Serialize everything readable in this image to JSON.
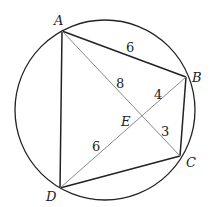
{
  "diagram": {
    "type": "cyclic-quadrilateral",
    "points": {
      "A": {
        "label": "A",
        "x": 62,
        "y": 31,
        "lx": 54,
        "ly": 25
      },
      "B": {
        "label": "B",
        "x": 186,
        "y": 77,
        "lx": 192,
        "ly": 82
      },
      "C": {
        "label": "C",
        "x": 180,
        "y": 156,
        "lx": 186,
        "ly": 167
      },
      "D": {
        "label": "D",
        "x": 60,
        "y": 188,
        "lx": 46,
        "ly": 201
      },
      "E": {
        "label": "E",
        "x": 143,
        "y": 116,
        "lx": 121,
        "ly": 126
      }
    },
    "circle": {
      "cx": 105,
      "cy": 110,
      "r": 90
    },
    "lengths": [
      {
        "segment": "AB",
        "value": "6",
        "x": 126,
        "y": 52
      },
      {
        "segment": "AE",
        "value": "8",
        "x": 116,
        "y": 88
      },
      {
        "segment": "BE",
        "value": "4",
        "x": 154,
        "y": 99
      },
      {
        "segment": "EC",
        "value": "3",
        "x": 161,
        "y": 136
      },
      {
        "segment": "DE",
        "value": "6",
        "x": 92,
        "y": 151
      }
    ]
  }
}
